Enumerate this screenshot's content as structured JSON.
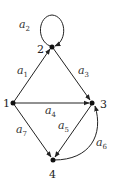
{
  "diagram": {
    "type": "directed-graph",
    "colors": {
      "line": "#222222",
      "node": "#111111",
      "background": "#ffffff"
    },
    "nodes": [
      {
        "id": "1",
        "label": "1"
      },
      {
        "id": "2",
        "label": "2"
      },
      {
        "id": "3",
        "label": "3"
      },
      {
        "id": "4",
        "label": "4"
      }
    ],
    "edges": [
      {
        "id": "a1",
        "base": "a",
        "sub": "1",
        "from": "1",
        "to": "2"
      },
      {
        "id": "a2",
        "base": "a",
        "sub": "2",
        "from": "2",
        "to": "2",
        "kind": "self-loop"
      },
      {
        "id": "a3",
        "base": "a",
        "sub": "3",
        "from": "2",
        "to": "3"
      },
      {
        "id": "a4",
        "base": "a",
        "sub": "4",
        "from": "1",
        "to": "3"
      },
      {
        "id": "a5",
        "base": "a",
        "sub": "5",
        "from": "3",
        "to": "4"
      },
      {
        "id": "a6",
        "base": "a",
        "sub": "6",
        "from": "4",
        "to": "3",
        "kind": "curved"
      },
      {
        "id": "a7",
        "base": "a",
        "sub": "7",
        "from": "1",
        "to": "4"
      }
    ]
  }
}
